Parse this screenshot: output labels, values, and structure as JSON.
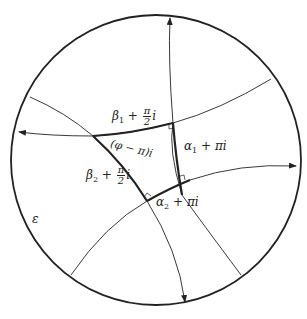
{
  "figure": {
    "type": "hyperbolic right-angled hexagon diagram in disk",
    "boundary_label": "ε",
    "labels": {
      "beta1": {
        "base": "β",
        "sub": "1",
        "plus": "+",
        "num": "π",
        "den": "2",
        "tail": "i"
      },
      "beta2": {
        "base": "β",
        "sub": "2",
        "plus": "+",
        "num": "π",
        "den": "2",
        "tail": "i"
      },
      "alpha1": {
        "base": "α",
        "sub": "1",
        "rest": "+ πi"
      },
      "alpha2": {
        "base": "α",
        "sub": "2",
        "rest": "+ πi"
      },
      "phi": "(φ − π)i"
    },
    "colors": {
      "stroke": "#222222",
      "background": "#ffffff"
    }
  }
}
